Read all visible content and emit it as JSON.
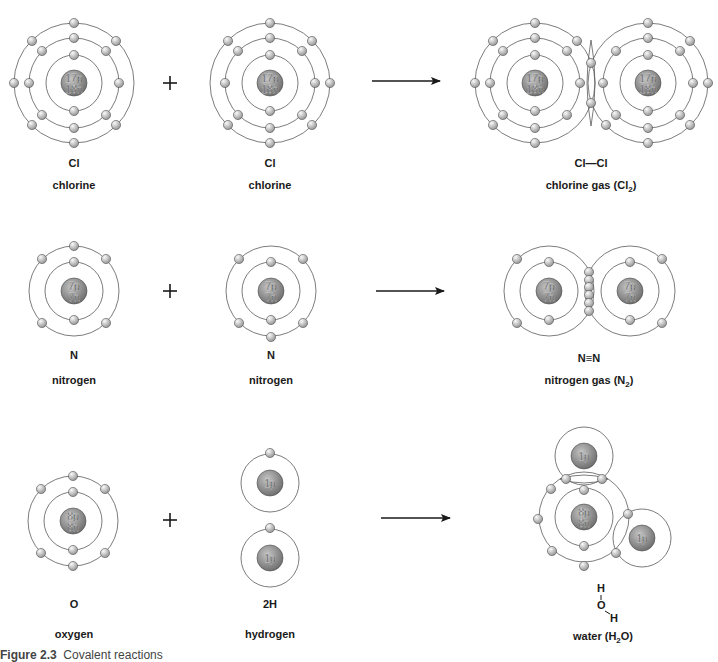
{
  "figure": {
    "caption_label": "Figure 2.3",
    "caption_text": "Covalent reactions"
  },
  "colors": {
    "shell": "#5a5a5a",
    "nucleus_light": "#b8b8b8",
    "nucleus_dark": "#6e6e6e",
    "electron_light": "#f2f2f2",
    "electron_dark": "#9a9a9a",
    "text": "#1a1a1a"
  },
  "rows": [
    {
      "reactants": [
        {
          "symbol": "Cl",
          "name": "chlorine",
          "nucleus": [
            "17p",
            "18n"
          ]
        },
        {
          "symbol": "Cl",
          "name": "chlorine",
          "nucleus": [
            "17p",
            "18n"
          ]
        }
      ],
      "operator": "+",
      "product": {
        "formula": "Cl—Cl",
        "name_prefix": "chlorine gas (Cl",
        "name_sub": "2",
        "name_suffix": ")"
      }
    },
    {
      "reactants": [
        {
          "symbol": "N",
          "name": "nitrogen",
          "nucleus": [
            "7p",
            "7n"
          ]
        },
        {
          "symbol": "N",
          "name": "nitrogen",
          "nucleus": [
            "7p",
            "7n"
          ]
        }
      ],
      "operator": "+",
      "product": {
        "formula": "N≡N",
        "name_prefix": "nitrogen gas (N",
        "name_sub": "2",
        "name_suffix": ")"
      }
    },
    {
      "reactants": [
        {
          "symbol": "O",
          "name": "oxygen",
          "nucleus": [
            "8p",
            "8n"
          ]
        },
        {
          "symbol": "2H",
          "name": "hydrogen",
          "nucleus": [
            "1p"
          ]
        }
      ],
      "operator": "+",
      "product": {
        "structural": {
          "h_top": "H",
          "o": "O",
          "h_right": "H"
        },
        "name_prefix": "water (H",
        "name_sub": "2",
        "name_suffix": "O)"
      }
    }
  ],
  "atoms": [
    {
      "id": "cl-1",
      "cx": 74,
      "cy": 83,
      "shells": [
        28,
        45,
        60
      ],
      "nucleus": [
        "17p",
        "18n"
      ],
      "electrons": [
        [
          74,
          55
        ],
        [
          74,
          111
        ],
        [
          74,
          38
        ],
        [
          74,
          128
        ],
        [
          29,
          83
        ],
        [
          119,
          83
        ],
        [
          42,
          51
        ],
        [
          106,
          51
        ],
        [
          42,
          115
        ],
        [
          106,
          115
        ],
        [
          74,
          23
        ],
        [
          74,
          143
        ],
        [
          14,
          83
        ],
        [
          32,
          41
        ],
        [
          116,
          41
        ],
        [
          32,
          125
        ],
        [
          116,
          125
        ]
      ]
    },
    {
      "id": "cl-2",
      "cx": 270,
      "cy": 83,
      "shells": [
        28,
        45,
        60
      ],
      "nucleus": [
        "17p",
        "18n"
      ],
      "electrons": [
        [
          270,
          55
        ],
        [
          270,
          111
        ],
        [
          270,
          38
        ],
        [
          270,
          128
        ],
        [
          225,
          83
        ],
        [
          315,
          83
        ],
        [
          238,
          51
        ],
        [
          302,
          51
        ],
        [
          238,
          115
        ],
        [
          302,
          115
        ],
        [
          270,
          23
        ],
        [
          270,
          143
        ],
        [
          330,
          83
        ],
        [
          228,
          41
        ],
        [
          312,
          41
        ],
        [
          228,
          125
        ],
        [
          312,
          125
        ]
      ]
    },
    {
      "id": "cl2-left",
      "cx": 535,
      "cy": 83,
      "shells": [
        28,
        45,
        60
      ],
      "nucleus": [
        "17p",
        "18n"
      ],
      "electrons": [
        [
          535,
          55
        ],
        [
          535,
          111
        ],
        [
          535,
          38
        ],
        [
          535,
          128
        ],
        [
          490,
          83
        ],
        [
          580,
          83
        ],
        [
          503,
          51
        ],
        [
          567,
          51
        ],
        [
          503,
          115
        ],
        [
          567,
          115
        ],
        [
          535,
          23
        ],
        [
          535,
          143
        ],
        [
          475,
          83
        ],
        [
          493,
          41
        ],
        [
          577,
          41
        ],
        [
          493,
          125
        ]
      ]
    },
    {
      "id": "cl2-right",
      "cx": 648,
      "cy": 83,
      "shells": [
        28,
        45,
        60
      ],
      "nucleus": [
        "17p",
        "18n"
      ],
      "electrons": [
        [
          648,
          55
        ],
        [
          648,
          111
        ],
        [
          648,
          38
        ],
        [
          648,
          128
        ],
        [
          603,
          83
        ],
        [
          693,
          83
        ],
        [
          616,
          51
        ],
        [
          680,
          51
        ],
        [
          616,
          115
        ],
        [
          680,
          115
        ],
        [
          648,
          23
        ],
        [
          648,
          143
        ],
        [
          708,
          83
        ],
        [
          690,
          41
        ],
        [
          690,
          125
        ],
        [
          606,
          125
        ]
      ]
    },
    {
      "id": "n-1",
      "cx": 74,
      "cy": 291,
      "shells": [
        29,
        45
      ],
      "nucleus": [
        "7p",
        "7n"
      ],
      "electrons": [
        [
          74,
          262
        ],
        [
          74,
          320
        ],
        [
          74,
          246
        ],
        [
          42,
          259
        ],
        [
          106,
          259
        ],
        [
          42,
          323
        ],
        [
          106,
          323
        ]
      ]
    },
    {
      "id": "n-2",
      "cx": 271,
      "cy": 291,
      "shells": [
        29,
        45
      ],
      "nucleus": [
        "7p",
        "7n"
      ],
      "electrons": [
        [
          271,
          262
        ],
        [
          271,
          320
        ],
        [
          271,
          337
        ],
        [
          239,
          259
        ],
        [
          303,
          259
        ],
        [
          239,
          323
        ],
        [
          303,
          323
        ]
      ]
    },
    {
      "id": "n2-left",
      "cx": 549,
      "cy": 291,
      "shells": [
        29,
        45
      ],
      "nucleus": [
        "7p",
        "7n"
      ],
      "electrons": [
        [
          549,
          262
        ],
        [
          549,
          320
        ],
        [
          517,
          259
        ],
        [
          517,
          323
        ]
      ]
    },
    {
      "id": "n2-right",
      "cx": 630,
      "cy": 291,
      "shells": [
        29,
        45
      ],
      "nucleus": [
        "7p",
        "7n"
      ],
      "electrons": [
        [
          630,
          262
        ],
        [
          630,
          320
        ],
        [
          662,
          259
        ],
        [
          662,
          323
        ]
      ]
    },
    {
      "id": "o-1",
      "cx": 73,
      "cy": 521,
      "shells": [
        29,
        45
      ],
      "nucleus": [
        "8p",
        "8n"
      ],
      "electrons": [
        [
          73,
          492
        ],
        [
          73,
          550
        ],
        [
          73,
          476
        ],
        [
          73,
          566
        ],
        [
          41,
          489
        ],
        [
          105,
          489
        ],
        [
          41,
          553
        ],
        [
          105,
          553
        ]
      ]
    },
    {
      "id": "h-1",
      "cx": 270,
      "cy": 483,
      "shells": [
        29
      ],
      "nucleus": [
        "1p"
      ],
      "electrons": [
        [
          270,
          453
        ]
      ]
    },
    {
      "id": "h-2",
      "cx": 270,
      "cy": 558,
      "shells": [
        29
      ],
      "nucleus": [
        "1p"
      ],
      "electrons": [
        [
          270,
          528
        ]
      ]
    },
    {
      "id": "water-o",
      "cx": 584,
      "cy": 517,
      "shells": [
        29,
        45
      ],
      "nucleus": [
        "8p",
        "8n"
      ],
      "electrons": [
        [
          584,
          490
        ],
        [
          584,
          546
        ],
        [
          551,
          489
        ],
        [
          538,
          519
        ],
        [
          552,
          551
        ],
        [
          584,
          566
        ]
      ]
    },
    {
      "id": "water-h-top",
      "cx": 584,
      "cy": 456,
      "shells": [
        29
      ],
      "nucleus": [
        "1p"
      ],
      "electrons": []
    },
    {
      "id": "water-h-right",
      "cx": 642,
      "cy": 538,
      "shells": [
        29
      ],
      "nucleus": [
        "1p"
      ],
      "electrons": []
    }
  ],
  "shared_electrons": [
    {
      "id": "cl2-bond",
      "points": [
        [
          591,
          63
        ],
        [
          591,
          103
        ]
      ]
    },
    {
      "id": "n2-bond",
      "points": [
        [
          589,
          272
        ],
        [
          589,
          280
        ],
        [
          589,
          287
        ],
        [
          589,
          295
        ],
        [
          589,
          303
        ],
        [
          589,
          311
        ]
      ]
    },
    {
      "id": "water-bond-top",
      "points": [
        [
          566,
          479
        ],
        [
          602,
          479
        ]
      ]
    },
    {
      "id": "water-bond-right",
      "points": [
        [
          628,
          514
        ],
        [
          616,
          553
        ]
      ]
    }
  ],
  "arrows": [
    {
      "id": "arrow-1",
      "x1": 372,
      "x2": 440,
      "y": 81
    },
    {
      "id": "arrow-2",
      "x1": 376,
      "x2": 444,
      "y": 291
    },
    {
      "id": "arrow-3",
      "x1": 381,
      "x2": 450,
      "y": 518
    }
  ],
  "plus_signs": [
    {
      "id": "plus-1",
      "x": 170,
      "y": 83
    },
    {
      "id": "plus-2",
      "x": 170,
      "y": 291
    },
    {
      "id": "plus-3",
      "x": 170,
      "y": 520
    }
  ]
}
